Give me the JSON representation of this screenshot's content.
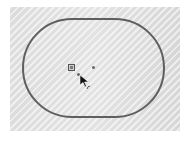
{
  "canvas": {
    "background_color": "#d9d9d9",
    "pattern": "diagonal-hatch"
  },
  "sketch": {
    "shape": "slot",
    "stroke_color": "#5f5f5f",
    "points": [
      {
        "name": "selected-point",
        "x": 71,
        "y": 67
      },
      {
        "name": "center-point",
        "x": 93,
        "y": 67
      },
      {
        "name": "endpoint",
        "x": 78,
        "y": 74
      }
    ]
  },
  "cursor": {
    "icon": "arrow-cursor",
    "badge": "arc-icon"
  }
}
